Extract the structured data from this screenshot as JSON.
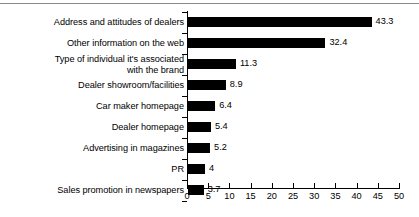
{
  "figure": {
    "has_top_rule": true,
    "background_color": "#ffffff",
    "bar_color": "#000000",
    "axis_color": "#000000",
    "rule_color": "#8a8a8a"
  },
  "chart_data": {
    "type": "bar",
    "orientation": "horizontal",
    "title": "",
    "subtitle": "",
    "xlabel": "",
    "ylabel": "",
    "categories": [
      "Address and attitudes of dealers",
      "Other information on the web",
      "Type of individual it's associated\nwith the brand",
      "Dealer showroom/facilities",
      "Car maker homepage",
      "Dealer homepage",
      "Advertising in magazines",
      "PR",
      "Sales promotion in newspapers"
    ],
    "values": [
      43.3,
      32.4,
      11.3,
      8.9,
      6.4,
      5.4,
      5.2,
      4,
      3.7
    ],
    "value_labels": [
      "43.3",
      "32.4",
      "11.3",
      "8.9",
      "6.4",
      "5.4",
      "5.2",
      "4",
      "3.7"
    ],
    "xlim": [
      0,
      50
    ],
    "xticks": [
      0,
      5,
      10,
      15,
      20,
      25,
      30,
      35,
      40,
      45,
      50
    ],
    "xtick_labels": [
      "0",
      "5",
      "10",
      "15",
      "20",
      "25",
      "30",
      "35",
      "40",
      "45",
      "50"
    ],
    "grid": false,
    "legend": null,
    "legend_position": "none",
    "annotations": []
  }
}
